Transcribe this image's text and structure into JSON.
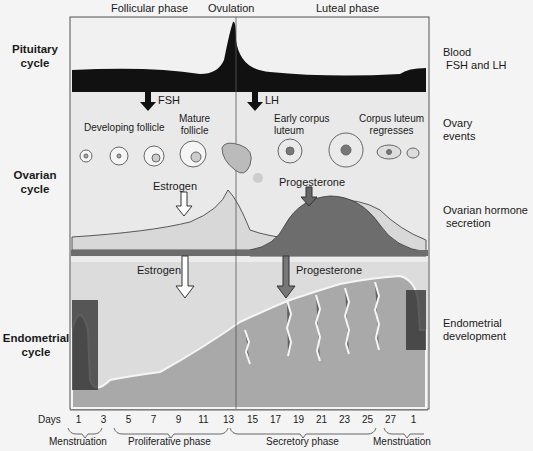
{
  "phases_top": {
    "follicular": "Follicular phase",
    "ovulation": "Ovulation",
    "luteal": "Luteal phase"
  },
  "left_labels": {
    "pituitary": [
      "Pituitary",
      "cycle"
    ],
    "ovarian": [
      "Ovarian",
      "cycle"
    ],
    "endometrial": [
      "Endometrial",
      "cycle"
    ]
  },
  "right_labels": {
    "blood": [
      "Blood",
      "FSH and LH"
    ],
    "ovary_events": [
      "Ovary",
      "events"
    ],
    "ovarian_hormone": [
      "Ovarian hormone",
      "secretion"
    ],
    "endometrial_dev": [
      "Endometrial",
      "development"
    ]
  },
  "hormone_arrows": {
    "fsh": "FSH",
    "lh": "LH",
    "estrogen_ovary": "Estrogen",
    "progesterone_ovary": "Progesterone",
    "estrogen_endo": "Estrogen",
    "progesterone_endo": "Progesterone"
  },
  "follicle_labels": {
    "developing": "Developing follicle",
    "mature": [
      "Mature",
      "follicle"
    ],
    "early_cl": [
      "Early corpus",
      "luteum"
    ],
    "cl_regresses": [
      "Corpus luteum",
      "regresses"
    ]
  },
  "days": {
    "label": "Days",
    "ticks": [
      "1",
      "3",
      "5",
      "7",
      "9",
      "11",
      "13",
      "15",
      "17",
      "19",
      "21",
      "23",
      "25",
      "27",
      "1"
    ]
  },
  "endometrial_phases": [
    "Menstruation",
    "Proliferative phase",
    "Secretory phase",
    "Menstruation"
  ],
  "colors": {
    "pituitary_band": "#111111",
    "estrogen_fill": "#d6d6d6",
    "progesterone_fill": "#6a6a6a",
    "endometrium": "#a8a8a8",
    "panel_bg": "#e8e8e8"
  }
}
